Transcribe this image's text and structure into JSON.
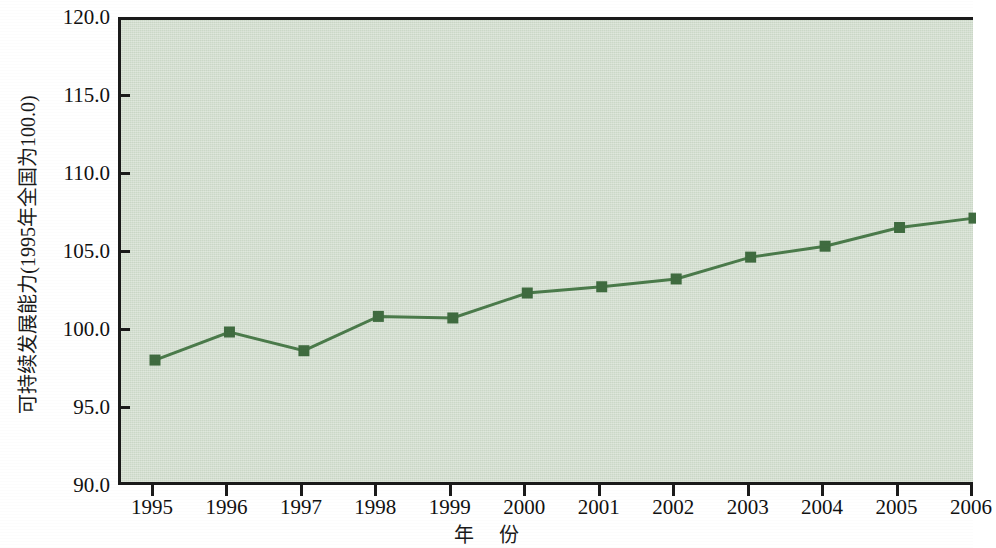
{
  "chart_data": {
    "type": "line",
    "title": "",
    "xlabel": "年 份",
    "ylabel": "可持续发展能力(1995年全国为100.0)",
    "categories": [
      "1995",
      "1996",
      "1997",
      "1998",
      "1999",
      "2000",
      "2001",
      "2002",
      "2003",
      "2004",
      "2005",
      "2006"
    ],
    "values": [
      98.2,
      100.0,
      98.8,
      101.0,
      100.9,
      102.5,
      102.9,
      103.4,
      104.8,
      105.5,
      106.7,
      107.3
    ],
    "series": [
      {
        "name": "可持续发展能力",
        "values": [
          98.2,
          100.0,
          98.8,
          101.0,
          100.9,
          102.5,
          102.9,
          103.4,
          104.8,
          105.5,
          106.7,
          107.3
        ]
      }
    ],
    "ylim": [
      90.0,
      120.0
    ],
    "y_ticks": [
      "90.0",
      "95.0",
      "100.0",
      "105.0",
      "110.0",
      "115.0",
      "120.0"
    ],
    "y_tick_values": [
      90.0,
      95.0,
      100.0,
      105.0,
      110.0,
      115.0,
      120.0
    ],
    "x_ticks": [
      "1995",
      "1996",
      "1997",
      "1998",
      "1999",
      "2000",
      "2001",
      "2002",
      "2003",
      "2004",
      "2005",
      "2006"
    ],
    "grid": false,
    "legend": "none",
    "marker": "square",
    "colors": {
      "line": "#4a7a4a",
      "marker": "#3f6b3f",
      "plot_background": "#cbd8c7",
      "axis": "#1a1a1a",
      "text": "#111111",
      "page_background": "#ffffff"
    }
  }
}
